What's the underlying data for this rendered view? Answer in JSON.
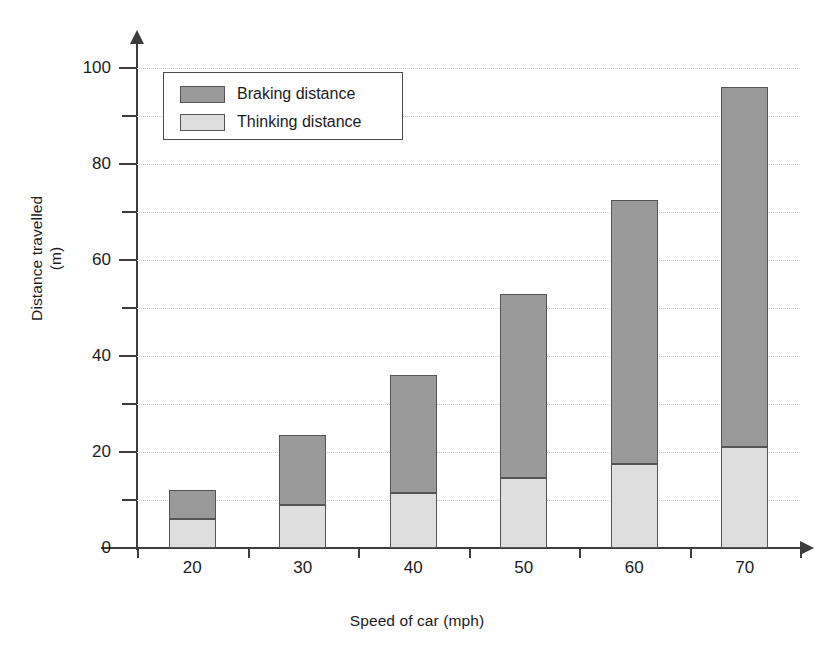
{
  "chart_data": {
    "type": "bar",
    "subtype": "stacked-bar",
    "title": "",
    "xlabel": "Speed of car (mph)",
    "ylabel": "Distance travelled\n(m)",
    "categories": [
      "20",
      "30",
      "40",
      "50",
      "60",
      "70"
    ],
    "series": [
      {
        "name": "Thinking distance",
        "values": [
          6,
          9,
          11.5,
          14.5,
          17.5,
          21
        ],
        "color": "#dedede"
      },
      {
        "name": "Braking distance",
        "values": [
          6,
          14.5,
          24.5,
          38.5,
          55,
          75
        ],
        "color": "#9a9a9a"
      }
    ],
    "totals": [
      12,
      23.5,
      36,
      53,
      72.5,
      96
    ],
    "ylim": [
      0,
      100
    ],
    "y_major_ticks": [
      0,
      20,
      40,
      60,
      80,
      100
    ],
    "y_minor_ticks": [
      10,
      30,
      50,
      70,
      90
    ],
    "y_tick_labels": [
      "0",
      "20",
      "40",
      "60",
      "80",
      "100"
    ],
    "grid": true,
    "grid_style": "dotted",
    "grid_color": "#c2c2d8",
    "legend_position": "top-left",
    "legend_entries": [
      {
        "label": "Braking distance",
        "color": "#9a9a9a"
      },
      {
        "label": "Thinking distance",
        "color": "#dedede"
      }
    ],
    "axis_color": "#3c3c3c",
    "bar_border_color": "#555555",
    "background": "#ffffff"
  }
}
